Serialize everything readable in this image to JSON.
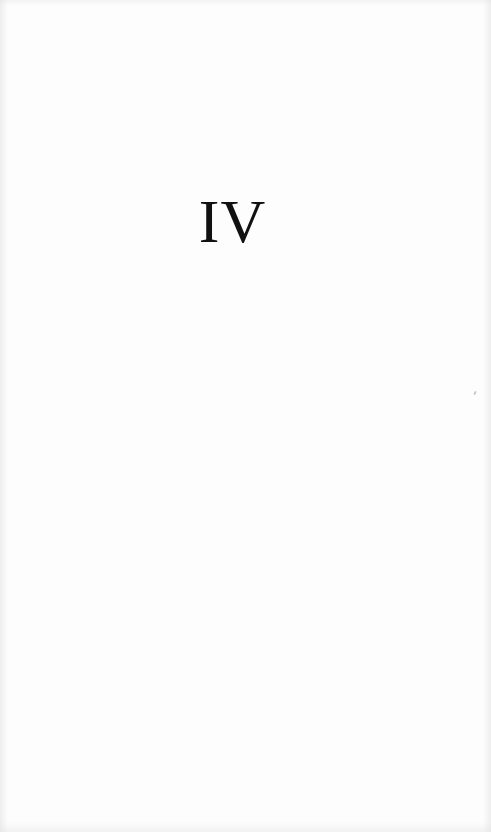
{
  "page": {
    "chapter_numeral": "IV",
    "background_color": "#fdfdfd",
    "text_color": "#111111"
  }
}
